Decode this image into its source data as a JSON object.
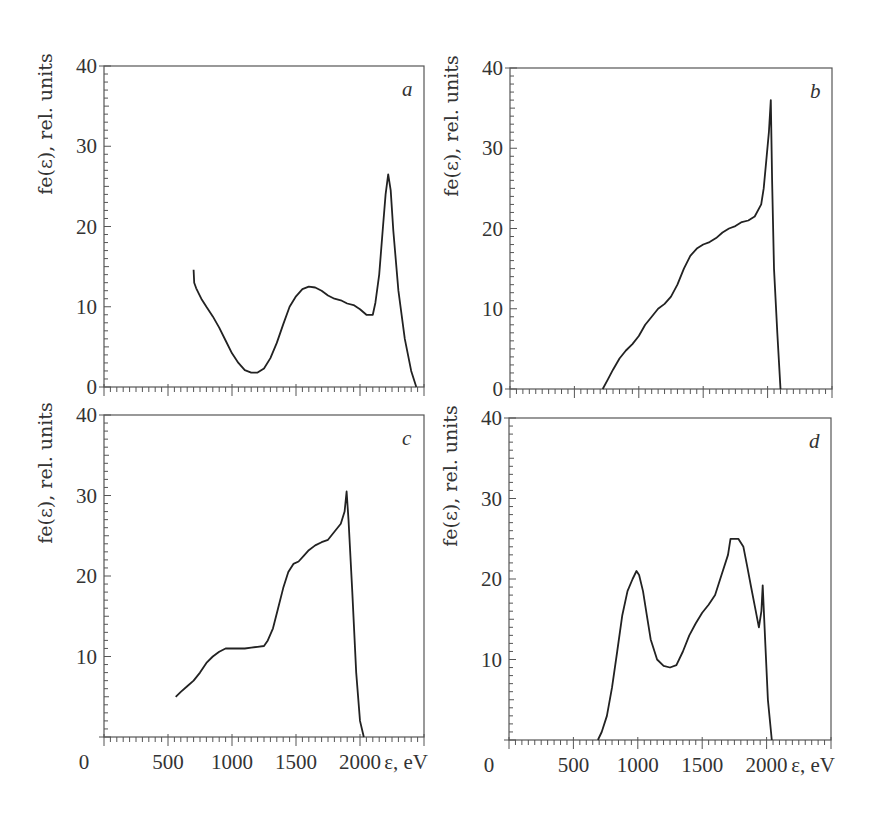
{
  "figure": {
    "ylabel": "fe(ε), rel. units",
    "xlabel": "ε, eV",
    "colors": {
      "axis": "#555555",
      "curve": "#222222",
      "background": "#ffffff"
    }
  },
  "chart_data": [
    {
      "type": "line",
      "panel": "a",
      "title": "",
      "xlabel": "",
      "ylabel": "fe(ε), rel. units",
      "xlim": [
        0,
        2500
      ],
      "ylim": [
        0,
        40
      ],
      "yticks": [
        0,
        10,
        20,
        30,
        40
      ],
      "xticks": [
        0,
        500,
        1000,
        1500,
        2000,
        2500
      ],
      "xtick_labels_shown": false,
      "grid": false,
      "series": [
        {
          "name": "a",
          "x": [
            700,
            705,
            720,
            760,
            800,
            850,
            900,
            950,
            1000,
            1050,
            1100,
            1150,
            1200,
            1250,
            1300,
            1350,
            1400,
            1450,
            1500,
            1550,
            1600,
            1650,
            1700,
            1750,
            1800,
            1850,
            1900,
            1950,
            2000,
            2050,
            2100,
            2120,
            2150,
            2180,
            2200,
            2220,
            2240,
            2260,
            2300,
            2350,
            2400,
            2440
          ],
          "y": [
            14.6,
            13.0,
            12.3,
            11.0,
            10.0,
            8.8,
            7.4,
            5.8,
            4.2,
            3.0,
            2.1,
            1.8,
            1.8,
            2.3,
            3.6,
            5.5,
            7.8,
            10.0,
            11.3,
            12.2,
            12.5,
            12.4,
            12.0,
            11.4,
            11.0,
            10.8,
            10.4,
            10.2,
            9.7,
            9.0,
            9.0,
            10.5,
            14.0,
            20.0,
            24.0,
            26.5,
            24.5,
            19.5,
            12.0,
            6.0,
            2.0,
            0.0
          ]
        }
      ]
    },
    {
      "type": "line",
      "panel": "b",
      "title": "",
      "xlabel": "",
      "ylabel": "fe(ε), rel. units",
      "xlim": [
        0,
        2500
      ],
      "ylim": [
        0,
        40
      ],
      "yticks": [
        0,
        10,
        20,
        30,
        40
      ],
      "xticks": [
        0,
        500,
        1000,
        1500,
        2000,
        2500
      ],
      "xtick_labels_shown": false,
      "grid": false,
      "series": [
        {
          "name": "b",
          "x": [
            720,
            760,
            800,
            850,
            900,
            950,
            1000,
            1050,
            1100,
            1150,
            1200,
            1250,
            1300,
            1350,
            1400,
            1450,
            1500,
            1550,
            1600,
            1650,
            1700,
            1750,
            1800,
            1850,
            1900,
            1950,
            1970,
            1990,
            2010,
            2025,
            2035,
            2050,
            2075,
            2100
          ],
          "y": [
            0.0,
            1.2,
            2.4,
            3.8,
            4.8,
            5.6,
            6.6,
            8.0,
            9.0,
            10.0,
            10.6,
            11.5,
            13.0,
            15.0,
            16.6,
            17.5,
            18.0,
            18.3,
            18.8,
            19.5,
            20.0,
            20.3,
            20.8,
            21.0,
            21.5,
            23.0,
            25.0,
            28.5,
            32.0,
            36.0,
            26.0,
            15.0,
            7.0,
            0.0
          ]
        }
      ]
    },
    {
      "type": "line",
      "panel": "c",
      "title": "",
      "xlabel": "ε, eV",
      "ylabel": "fe(ε), rel. units",
      "xlim": [
        0,
        2500
      ],
      "ylim": [
        0,
        40
      ],
      "yticks": [
        10,
        20,
        30,
        40
      ],
      "xticks": [
        0,
        500,
        1000,
        1500,
        2000,
        2500
      ],
      "xtick_labels": [
        "0",
        "500",
        "1000",
        "1500",
        "2000"
      ],
      "grid": false,
      "series": [
        {
          "name": "c",
          "x": [
            560,
            600,
            650,
            700,
            750,
            800,
            850,
            900,
            950,
            1000,
            1050,
            1100,
            1150,
            1200,
            1250,
            1280,
            1320,
            1360,
            1400,
            1440,
            1480,
            1520,
            1560,
            1600,
            1650,
            1700,
            1750,
            1800,
            1850,
            1880,
            1895,
            1910,
            1940,
            1970,
            2000,
            2030
          ],
          "y": [
            5.0,
            5.6,
            6.3,
            7.0,
            8.0,
            9.2,
            10.0,
            10.6,
            11.0,
            11.0,
            11.0,
            11.0,
            11.1,
            11.2,
            11.3,
            12.0,
            13.5,
            16.0,
            18.5,
            20.5,
            21.5,
            21.8,
            22.5,
            23.2,
            23.8,
            24.2,
            24.5,
            25.5,
            26.5,
            28.0,
            30.5,
            27.0,
            18.0,
            8.0,
            2.0,
            0.0
          ]
        }
      ]
    },
    {
      "type": "line",
      "panel": "d",
      "title": "",
      "xlabel": "ε, eV",
      "ylabel": "fe(ε), rel. units",
      "xlim": [
        0,
        2500
      ],
      "ylim": [
        0,
        40
      ],
      "yticks": [
        10,
        20,
        30,
        40
      ],
      "xticks": [
        0,
        500,
        1000,
        1500,
        2000,
        2500
      ],
      "xtick_labels": [
        "0",
        "500",
        "1000",
        "1500",
        "2000"
      ],
      "grid": false,
      "series": [
        {
          "name": "d",
          "x": [
            690,
            720,
            760,
            800,
            840,
            880,
            920,
            960,
            990,
            1010,
            1040,
            1070,
            1100,
            1150,
            1200,
            1250,
            1300,
            1350,
            1400,
            1450,
            1500,
            1550,
            1600,
            1650,
            1700,
            1720,
            1780,
            1820,
            1850,
            1880,
            1910,
            1940,
            1960,
            1970,
            1990,
            2010,
            2040
          ],
          "y": [
            0.0,
            1.0,
            3.0,
            6.5,
            11.0,
            15.5,
            18.5,
            20.0,
            21.0,
            20.5,
            18.5,
            15.5,
            12.5,
            10.0,
            9.2,
            9.0,
            9.3,
            11.0,
            13.0,
            14.5,
            15.8,
            16.8,
            18.0,
            20.5,
            23.0,
            25.0,
            25.0,
            24.0,
            21.5,
            19.0,
            16.5,
            14.0,
            16.0,
            19.2,
            12.0,
            5.0,
            0.0
          ]
        }
      ]
    }
  ],
  "panels": [
    {
      "letter": "a",
      "box": {
        "x": 104,
        "y": 66,
        "w": 320,
        "h": 321
      },
      "ytick_labels": [
        "0",
        "10",
        "20",
        "30",
        "40"
      ],
      "ytick_values": [
        0,
        10,
        20,
        30,
        40
      ],
      "show_xlabels": false
    },
    {
      "letter": "b",
      "box": {
        "x": 510,
        "y": 68,
        "w": 322,
        "h": 321
      },
      "ytick_labels": [
        "0",
        "10",
        "20",
        "30",
        "40"
      ],
      "ytick_values": [
        0,
        10,
        20,
        30,
        40
      ],
      "show_xlabels": false
    },
    {
      "letter": "c",
      "box": {
        "x": 104,
        "y": 415,
        "w": 320,
        "h": 322
      },
      "ytick_labels": [
        "10",
        "20",
        "30",
        "40"
      ],
      "ytick_values": [
        10,
        20,
        30,
        40
      ],
      "show_xlabels": true
    },
    {
      "letter": "d",
      "box": {
        "x": 509,
        "y": 418,
        "w": 322,
        "h": 322
      },
      "ytick_labels": [
        "10",
        "20",
        "30",
        "40"
      ],
      "ytick_values": [
        10,
        20,
        30,
        40
      ],
      "show_xlabels": true
    }
  ],
  "xaxis_labels": {
    "values": [
      "0",
      "500",
      "1000",
      "1500",
      "2000"
    ],
    "positions": [
      0,
      500,
      1000,
      1500,
      2000
    ],
    "unit_label": "ε, eV",
    "zero_offset_px": -20
  }
}
